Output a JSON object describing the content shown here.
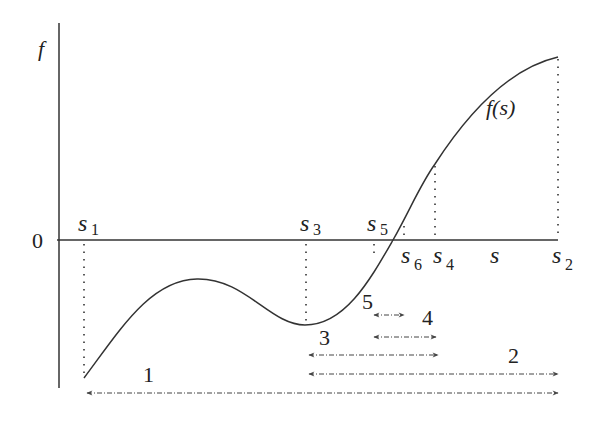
{
  "figure": {
    "y_axis_label": "f",
    "x_axis_label": "s",
    "zero_label": "0",
    "curve_label": "f(s)",
    "points": [
      {
        "name": "s",
        "sub": "1",
        "x": 84
      },
      {
        "name": "s",
        "sub": "3",
        "x": 306
      },
      {
        "name": "s",
        "sub": "5",
        "x": 374
      },
      {
        "name": "s",
        "sub": "6",
        "x": 403
      },
      {
        "name": "s",
        "sub": "4",
        "x": 435
      },
      {
        "name": "s",
        "sub": "2",
        "x": 558
      }
    ],
    "intervals": [
      {
        "label": "1",
        "from": "s1",
        "to": "s2"
      },
      {
        "label": "2",
        "from": "s3",
        "to": "s2"
      },
      {
        "label": "3",
        "from": "s3",
        "to": "s4"
      },
      {
        "label": "4",
        "from": "s5",
        "to": "s4"
      },
      {
        "label": "5",
        "from": "s5",
        "to": "s6"
      }
    ]
  },
  "colors": {
    "line": "#333333",
    "background": "#ffffff"
  }
}
